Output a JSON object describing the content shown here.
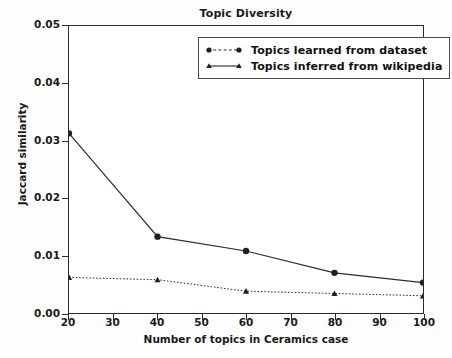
{
  "chart_data": {
    "type": "line",
    "title": "Topic Diversity",
    "xlabel": "Number of topics in Ceramics case",
    "ylabel": "Jaccard similarity",
    "x": [
      20,
      40,
      60,
      80,
      100
    ],
    "xlim": [
      20,
      100
    ],
    "ylim": [
      0.0,
      0.05
    ],
    "xticks": [
      "20",
      "30",
      "40",
      "50",
      "60",
      "70",
      "80",
      "90",
      "100"
    ],
    "xtick_values": [
      20,
      30,
      40,
      50,
      60,
      70,
      80,
      90,
      100
    ],
    "yticks": [
      "0.00",
      "0.01",
      "0.02",
      "0.03",
      "0.04",
      "0.05"
    ],
    "ytick_values": [
      0.0,
      0.01,
      0.02,
      0.03,
      0.04,
      0.05
    ],
    "grid": false,
    "legend_position": "upper right",
    "series": [
      {
        "name": "Topics learned from dataset",
        "values": [
          0.0313,
          0.0133,
          0.0108,
          0.007,
          0.0053
        ],
        "marker": "circle",
        "linestyle": "solid",
        "color": "#2b2b2b"
      },
      {
        "name": "Topics inferred from wikipedia",
        "values": [
          0.0062,
          0.0058,
          0.0038,
          0.0034,
          0.003
        ],
        "marker": "triangle",
        "linestyle": "dotted",
        "color": "#2b2b2b"
      }
    ]
  },
  "legend": {
    "items": [
      {
        "label": "Topics learned from dataset"
      },
      {
        "label": "Topics inferred from wikipedia"
      }
    ]
  }
}
